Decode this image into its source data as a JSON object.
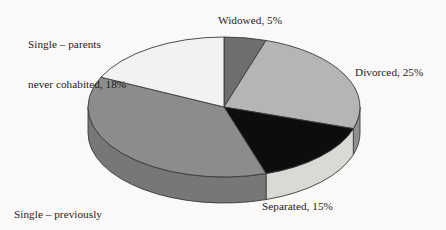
{
  "chart_data": {
    "type": "pie",
    "title": "",
    "subtitle": "",
    "xlabel": "",
    "ylabel": "",
    "legend_position": "none",
    "grid": false,
    "three_d": true,
    "start_angle_deg": 0,
    "direction": "clockwise",
    "units": "percent",
    "categories": [
      "Widowed",
      "Divorced",
      "Separated",
      "Single – previously cohabiting",
      "Single – parents never cohabited"
    ],
    "values": [
      5,
      25,
      15,
      37,
      18
    ],
    "slices": [
      {
        "name": "Widowed",
        "value": 5,
        "label_text": "Widowed, 5%",
        "color": "#6e6e6e",
        "side_color": "#5a5a5a",
        "start_deg": 0,
        "end_deg": 18
      },
      {
        "name": "Divorced",
        "value": 25,
        "label_text": "Divorced, 25%",
        "color": "#b5b5b5",
        "side_color": "#8f8f8f",
        "start_deg": 18,
        "end_deg": 108
      },
      {
        "name": "Separated",
        "value": 15,
        "label_text": "Separated, 15%",
        "color": "#0d0d0d",
        "side_color": "#d9d9d6",
        "start_deg": 108,
        "end_deg": 162
      },
      {
        "name": "Single – previously cohabiting",
        "value": 37,
        "label_text_line1": "Single – previously",
        "label_text_line2": "cohabiting, 37%",
        "color": "#8c8c8c",
        "side_color": "#777777",
        "start_deg": 162,
        "end_deg": 295.2
      },
      {
        "name": "Single – parents never cohabited",
        "value": 18,
        "label_text_line1": "Single – parents",
        "label_text_line2": "never cohabited, 18%",
        "color": "#f2f2f0",
        "side_color": "#c8c8c5",
        "start_deg": 295.2,
        "end_deg": 360
      }
    ],
    "labels": {
      "never_cohabited_line1": "Single – parents",
      "never_cohabited_line2": "never cohabited, 18%",
      "widowed": "Widowed, 5%",
      "divorced": "Divorced, 25%",
      "separated": "Separated, 15%",
      "cohabiting_line1": "Single – previously",
      "cohabiting_line2": "cohabiting, 37%"
    },
    "colors": {
      "background": "#faf9f7",
      "outline": "#3a3a3a",
      "text": "#1a1a1a"
    }
  }
}
